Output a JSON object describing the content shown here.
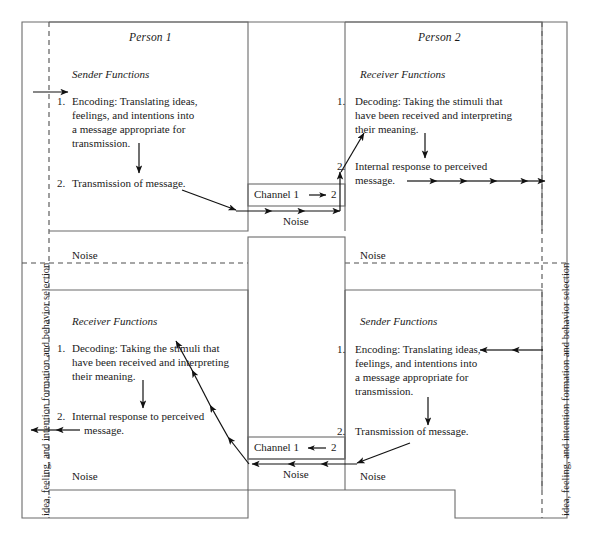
{
  "diagram": {
    "title_person1": "Person 1",
    "title_person2": "Person 2",
    "side_label_left": "idea, feeling, and intention formation and behavior selection",
    "side_label_right": "idea, feeling, and intention formation and behavior selection",
    "sender_heading": "Sender Functions",
    "receiver_heading": "Receiver Functions",
    "num1": "1.",
    "num2": "2.",
    "encoding_l1": "Encoding: Translating ideas,",
    "encoding_l2": "feelings, and intentions into",
    "encoding_l3": "a message appropriate for",
    "encoding_l4": "transmission.",
    "transmission": "Transmission of message.",
    "decoding_l1": "Decoding: Taking the stimuli that",
    "decoding_l2": "have been received and interpreting",
    "decoding_l3": "their meaning.",
    "internal_l1": "Internal response to perceived",
    "internal_l2": "message.",
    "channel_1to2": "Channel 1",
    "channel_1to2_target": "2",
    "channel_2to1": "Channel 1",
    "channel_2to1_target": "2",
    "noise": "Noise",
    "colors": {
      "ink": "#1a1a1a",
      "line": "#6b6b6b",
      "dash": "#4f4f4f",
      "arrow": "#111111",
      "background": "#ffffff"
    }
  },
  "quadrants": {
    "top_left": {
      "owner": "Person 1",
      "role": "Sender Functions",
      "steps": [
        "Encoding: Translating ideas, feelings, and intentions into a message appropriate for transmission.",
        "Transmission of message."
      ],
      "noise_label": "Noise"
    },
    "top_right": {
      "owner": "Person 2",
      "role": "Receiver Functions",
      "steps": [
        "Decoding: Taking the stimuli that have been received and interpreting their meaning.",
        "Internal response to perceived message."
      ],
      "noise_label": "Noise"
    },
    "bottom_left": {
      "owner": "Person 1",
      "role": "Receiver Functions",
      "steps": [
        "Decoding: Taking the stimuli that have been received and interpreting their meaning.",
        "Internal response to perceived message."
      ],
      "noise_label": "Noise"
    },
    "bottom_right": {
      "owner": "Person 2",
      "role": "Sender Functions",
      "steps": [
        "Encoding: Translating ideas, feelings, and intentions into a message appropriate for transmission.",
        "Transmission of message."
      ],
      "noise_label": "Noise"
    }
  },
  "channels": [
    {
      "name": "Channel 1",
      "direction": "to",
      "target": "2",
      "noise_label": "Noise",
      "position": "upper"
    },
    {
      "name": "Channel 1",
      "direction": "from",
      "target": "2",
      "noise_label": "Noise",
      "position": "lower"
    }
  ]
}
